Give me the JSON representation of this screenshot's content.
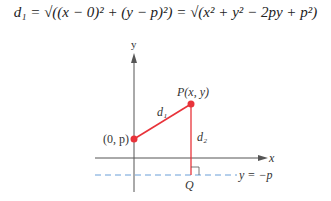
{
  "formula": {
    "text": "d₁ = √((x − 0)² + (y − p)²) = √(x² + y² − 2py + p²)"
  },
  "diagram": {
    "axis_labels": {
      "x": "x",
      "y": "y"
    },
    "points": [
      {
        "label": "(0, p)",
        "name": "focus"
      },
      {
        "label": "P(x, y)",
        "name": "point-p"
      },
      {
        "label": "Q",
        "name": "point-q"
      }
    ],
    "segments": [
      {
        "label": "d₁",
        "name": "distance-d1"
      },
      {
        "label": "d₂",
        "name": "distance-d2"
      }
    ],
    "directrix_label": "y = −p",
    "colors": {
      "accent": "#e8333a",
      "axis": "#555555",
      "directrix": "#6a9fd8"
    }
  }
}
